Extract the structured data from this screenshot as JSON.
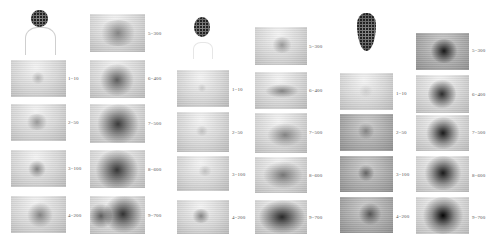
{
  "figure": {
    "groups": [
      {
        "id": "group-a",
        "sample_shape": "round-head-with-body-outline",
        "panels": [
          {
            "index": 1,
            "label": "1=10"
          },
          {
            "index": 2,
            "label": "2=50"
          },
          {
            "index": 3,
            "label": "3=100"
          },
          {
            "index": 4,
            "label": "4=200"
          },
          {
            "index": 5,
            "label": "5=300"
          },
          {
            "index": 6,
            "label": "6=400"
          },
          {
            "index": 7,
            "label": "7=500"
          },
          {
            "index": 8,
            "label": "8=600"
          },
          {
            "index": 9,
            "label": "9=700"
          }
        ]
      },
      {
        "id": "group-b",
        "sample_shape": "small-oval-head",
        "panels": [
          {
            "index": 1,
            "label": "1=10"
          },
          {
            "index": 2,
            "label": "2=50"
          },
          {
            "index": 3,
            "label": "3=100"
          },
          {
            "index": 4,
            "label": "4=200"
          },
          {
            "index": 5,
            "label": "5=300"
          },
          {
            "index": 6,
            "label": "6=400"
          },
          {
            "index": 7,
            "label": "7=500"
          },
          {
            "index": 8,
            "label": "8=600"
          },
          {
            "index": 9,
            "label": "9=700"
          }
        ]
      },
      {
        "id": "group-c",
        "sample_shape": "elongated-cone",
        "panels": [
          {
            "index": 1,
            "label": "1=10"
          },
          {
            "index": 2,
            "label": "2=50"
          },
          {
            "index": 3,
            "label": "3=100"
          },
          {
            "index": 4,
            "label": "4=200"
          },
          {
            "index": 5,
            "label": "5=300"
          },
          {
            "index": 6,
            "label": "6=400"
          },
          {
            "index": 7,
            "label": "7=500"
          },
          {
            "index": 8,
            "label": "8=600"
          },
          {
            "index": 9,
            "label": "9=700"
          }
        ]
      }
    ]
  }
}
